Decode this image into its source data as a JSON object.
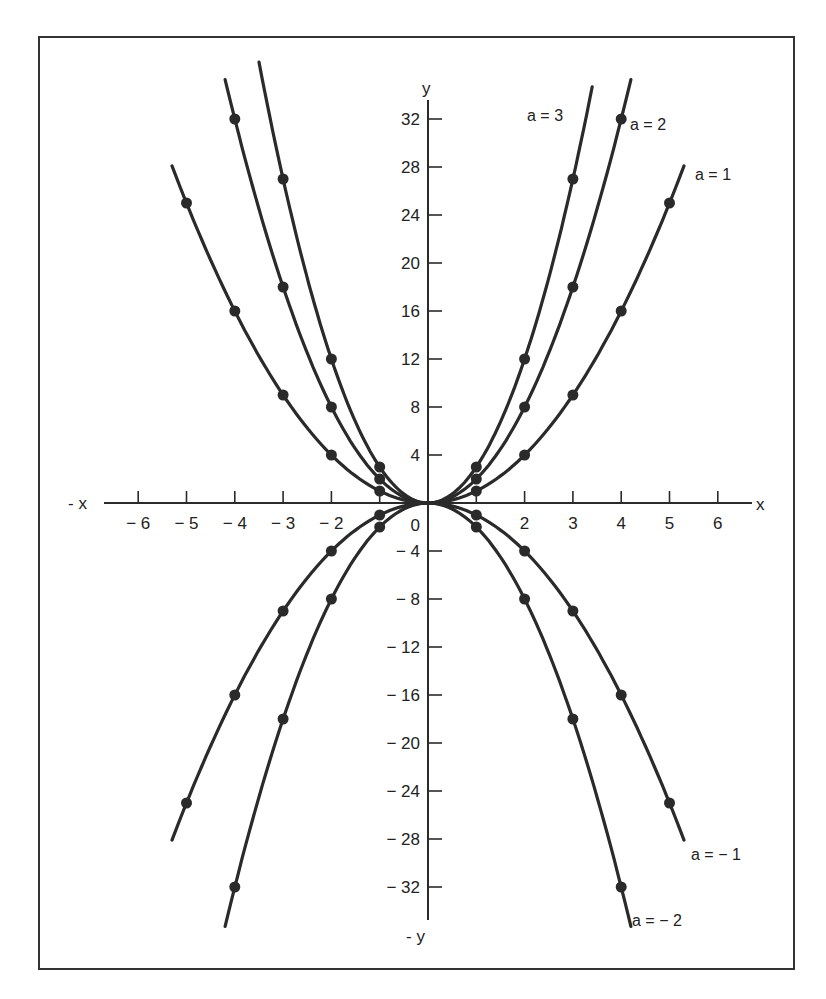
{
  "chart_data": {
    "type": "line",
    "title": "",
    "equation": "y = a x^2",
    "xlabel": "x",
    "xlabel_neg": "- x",
    "ylabel": "y",
    "ylabel_neg": "- y",
    "xlim": [
      -6.5,
      6.7
    ],
    "ylim": [
      -35,
      36
    ],
    "grid": false,
    "x_ticks": [
      -6,
      -5,
      -4,
      -3,
      -2,
      -1,
      1,
      2,
      3,
      4,
      5,
      6
    ],
    "x_tick_labels": [
      "− 6",
      "− 5",
      "− 4",
      "− 3",
      "− 2",
      "",
      "",
      "2",
      "3",
      "4",
      "5",
      "6"
    ],
    "y_ticks": [
      32,
      28,
      24,
      20,
      16,
      12,
      8,
      4,
      -4,
      -8,
      -12,
      -16,
      -20,
      -24,
      -28,
      -32
    ],
    "y_tick_labels": [
      "32",
      "28",
      "24",
      "20",
      "16",
      "12",
      "8",
      "4",
      "− 4",
      "− 8",
      "− 12",
      "− 16",
      "− 20",
      "− 24",
      "− 28",
      "− 32"
    ],
    "origin_label": "0",
    "series": [
      {
        "name": "a = 3",
        "a": 3,
        "x_range": [
          -3.5,
          3.4
        ],
        "points": [
          [
            -3,
            27
          ],
          [
            -2,
            12
          ],
          [
            -1,
            3
          ],
          [
            0,
            0
          ],
          [
            1,
            3
          ],
          [
            2,
            12
          ],
          [
            3,
            27
          ]
        ]
      },
      {
        "name": "a = 2",
        "a": 2,
        "x_range": [
          -4.2,
          4.2
        ],
        "points": [
          [
            -4,
            32
          ],
          [
            -3,
            18
          ],
          [
            -2,
            8
          ],
          [
            -1,
            2
          ],
          [
            0,
            0
          ],
          [
            1,
            2
          ],
          [
            2,
            8
          ],
          [
            3,
            18
          ],
          [
            4,
            32
          ]
        ]
      },
      {
        "name": "a = 1",
        "a": 1,
        "x_range": [
          -5.3,
          5.3
        ],
        "points": [
          [
            -5,
            25
          ],
          [
            -4,
            16
          ],
          [
            -3,
            9
          ],
          [
            -2,
            4
          ],
          [
            -1,
            1
          ],
          [
            0,
            0
          ],
          [
            1,
            1
          ],
          [
            2,
            4
          ],
          [
            3,
            9
          ],
          [
            4,
            16
          ],
          [
            5,
            25
          ]
        ]
      },
      {
        "name": "a = − 1",
        "a": -1,
        "x_range": [
          -5.3,
          5.3
        ],
        "points": [
          [
            -5,
            -25
          ],
          [
            -4,
            -16
          ],
          [
            -3,
            -9
          ],
          [
            -2,
            -4
          ],
          [
            -1,
            -1
          ],
          [
            0,
            0
          ],
          [
            1,
            -1
          ],
          [
            2,
            -4
          ],
          [
            3,
            -9
          ],
          [
            4,
            -16
          ],
          [
            5,
            -25
          ]
        ]
      },
      {
        "name": "a = − 2",
        "a": -2,
        "x_range": [
          -4.2,
          4.2
        ],
        "points": [
          [
            -4,
            -32
          ],
          [
            -3,
            -18
          ],
          [
            -2,
            -8
          ],
          [
            -1,
            -2
          ],
          [
            0,
            0
          ],
          [
            1,
            -2
          ],
          [
            2,
            -8
          ],
          [
            3,
            -18
          ],
          [
            4,
            -32
          ]
        ]
      }
    ],
    "legend_position": "inline labels at curve ends"
  },
  "layout": {
    "origin_px": [
      428,
      503
    ],
    "px_per_x": 48.3,
    "px_per_y": 12.0,
    "ink_color": "#2a2a2a"
  },
  "labels": {
    "a3": "a = 3",
    "a2": "a = 2",
    "a1": "a = 1",
    "am1": "a = − 1",
    "am2": "a = − 2"
  }
}
